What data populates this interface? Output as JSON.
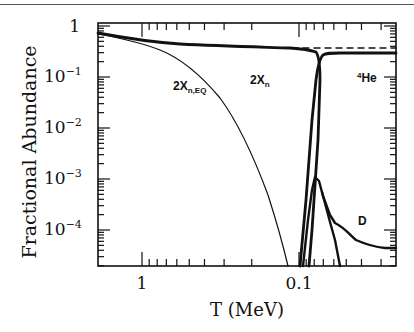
{
  "chart_data": {
    "type": "line",
    "title": "",
    "xlabel": "T (MeV)",
    "ylabel": "Fractional Abundance",
    "x_scale": "log",
    "x_reversed": true,
    "xlim": [
      1.9,
      0.024
    ],
    "y_scale": "log",
    "ylim": [
      1.9e-05,
      1.0
    ],
    "x_tick_labels": [
      "1",
      "0.1"
    ],
    "x_ticks": [
      1,
      0.1
    ],
    "y_tick_labels": [
      "1",
      "10-1",
      "10-2",
      "10-3",
      "10-4"
    ],
    "y_ticks": [
      1,
      0.1,
      0.01,
      0.001,
      0.0001
    ],
    "grid": false,
    "legend": null,
    "annotations": [
      "2X_n",
      "2X_n,EQ",
      "4He",
      "D"
    ],
    "series": [
      {
        "name": "2X_n",
        "style": "thick solid",
        "x": [
          1.9,
          1.0,
          0.5,
          0.3,
          0.15,
          0.1,
          0.085,
          0.078,
          0.074,
          0.071
        ],
        "y": [
          0.7,
          0.5,
          0.38,
          0.33,
          0.29,
          0.27,
          0.24,
          0.12,
          0.01,
          2e-05
        ]
      },
      {
        "name": "2X_n,EQ",
        "style": "thin solid",
        "x": [
          1.9,
          1.0,
          0.7,
          0.5,
          0.4,
          0.3,
          0.25,
          0.2,
          0.17,
          0.15,
          0.13,
          0.11
        ],
        "y": [
          0.7,
          0.45,
          0.3,
          0.17,
          0.1,
          0.04,
          0.02,
          0.005,
          0.0015,
          0.0005,
          0.00012,
          2e-05
        ]
      },
      {
        "name": "4He",
        "style": "thick solid",
        "x": [
          0.095,
          0.085,
          0.078,
          0.074,
          0.07,
          0.065,
          0.06,
          0.05,
          0.04,
          0.03,
          0.024
        ],
        "y": [
          2e-05,
          0.001,
          0.05,
          0.15,
          0.21,
          0.23,
          0.235,
          0.24,
          0.24,
          0.24,
          0.24
        ]
      },
      {
        "name": "4He asymptote",
        "style": "dashed",
        "x": [
          0.1,
          0.024
        ],
        "y": [
          0.27,
          0.27
        ]
      },
      {
        "name": "D",
        "style": "thick solid",
        "x": [
          0.095,
          0.085,
          0.08,
          0.075,
          0.068,
          0.06,
          0.05,
          0.04,
          0.03,
          0.024
        ],
        "y": [
          2e-05,
          0.002,
          0.0045,
          0.0035,
          0.001,
          0.00025,
          0.00016,
          0.0001,
          8e-05,
          8e-05
        ]
      },
      {
        "name": "D destruction branch",
        "style": "thick solid",
        "x": [
          0.068,
          0.063,
          0.058,
          0.055
        ],
        "y": [
          0.001,
          0.0001,
          3e-05,
          1.9e-05
        ]
      }
    ]
  },
  "labels": {
    "ylabel": "Fractional Abundance",
    "xlabel": "T (MeV)",
    "ann_xn": "2X",
    "ann_xn_sub": "n",
    "ann_xneq": "2X",
    "ann_xneq_sub": "n,EQ",
    "ann_he_sup": "4",
    "ann_he": "He",
    "ann_d": "D",
    "xtick_1": "1",
    "xtick_01": "0.1",
    "ytick_0": "1",
    "ytick_base": "10",
    "ytick_1_exp": "−1",
    "ytick_2_exp": "−2",
    "ytick_3_exp": "−3",
    "ytick_4_exp": "−4"
  }
}
